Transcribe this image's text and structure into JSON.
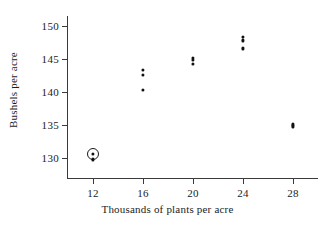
{
  "chart_data": {
    "type": "scatter",
    "title": "",
    "xlabel": "Thousands of plants per acre",
    "ylabel": "Bushels per acre",
    "xlim": [
      10,
      30
    ],
    "ylim": [
      127,
      151.5
    ],
    "xticks": [
      12,
      16,
      20,
      24,
      28
    ],
    "yticks": [
      130,
      135,
      140,
      145,
      150
    ],
    "xtick_labels": [
      "12",
      "16",
      "20",
      "24",
      "28"
    ],
    "ytick_labels": [
      "130",
      "135",
      "140",
      "145",
      "150"
    ],
    "grid": false,
    "legend": "none",
    "point_color": "#111111",
    "axis_color": "#3a3a3a",
    "points": [
      {
        "x": 12,
        "y": 130.6,
        "highlighted": true
      },
      {
        "x": 12,
        "y": 129.8,
        "highlighted": false
      },
      {
        "x": 16,
        "y": 143.4,
        "highlighted": false
      },
      {
        "x": 16,
        "y": 142.6,
        "highlighted": false
      },
      {
        "x": 16,
        "y": 140.3,
        "highlighted": false
      },
      {
        "x": 20,
        "y": 145.2,
        "highlighted": false
      },
      {
        "x": 20,
        "y": 144.9,
        "highlighted": false
      },
      {
        "x": 20,
        "y": 144.2,
        "highlighted": false
      },
      {
        "x": 24,
        "y": 148.3,
        "highlighted": false
      },
      {
        "x": 24,
        "y": 147.8,
        "highlighted": false
      },
      {
        "x": 24,
        "y": 146.6,
        "highlighted": false
      },
      {
        "x": 28,
        "y": 135.1,
        "highlighted": false
      },
      {
        "x": 28,
        "y": 134.8,
        "highlighted": false
      }
    ],
    "annotations": [
      {
        "kind": "circle-highlight",
        "x": 12,
        "y": 130.6
      }
    ]
  }
}
